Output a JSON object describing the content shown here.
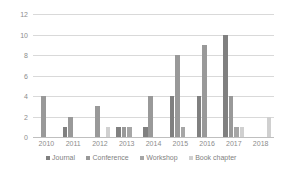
{
  "chart_data": {
    "type": "bar",
    "title": "",
    "subtitle": "",
    "xlabel": "",
    "ylabel": "",
    "categories": [
      "2010",
      "2011",
      "2012",
      "2013",
      "2014",
      "2015",
      "2016",
      "2017",
      "2018"
    ],
    "series": [
      {
        "name": "Journal",
        "color": "#808080",
        "values": [
          0,
          1,
          0,
          1,
          1,
          4,
          4,
          10,
          0
        ]
      },
      {
        "name": "Conference",
        "color": "#999999",
        "values": [
          4,
          2,
          3,
          1,
          4,
          8,
          9,
          4,
          0
        ]
      },
      {
        "name": "Workshop",
        "color": "#a6a6a6",
        "values": [
          0,
          0,
          0,
          1,
          0,
          1,
          0,
          1,
          0
        ]
      },
      {
        "name": "Book chapter",
        "color": "#d0d0d0",
        "values": [
          0,
          0,
          1,
          0,
          0,
          0,
          0,
          1,
          2
        ]
      }
    ],
    "ylim": [
      0,
      12
    ],
    "yticks": [
      0,
      2,
      4,
      6,
      8,
      10,
      12
    ],
    "ytick_labels": [
      "0",
      "2",
      "4",
      "6",
      "8",
      "10",
      "12"
    ],
    "grid": true,
    "grid_axis": "y",
    "legend_position": "bottom",
    "background": "#ffffff",
    "axis_color": "#d9d9d9",
    "tick_label_color": "#8c8c8c"
  }
}
